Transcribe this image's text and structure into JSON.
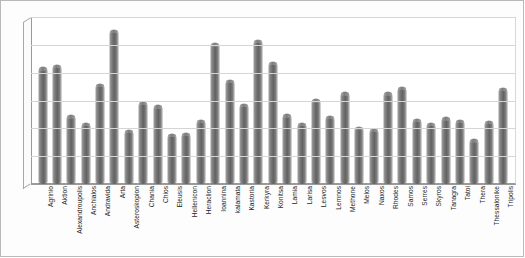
{
  "chart_data": {
    "type": "bar",
    "title": "",
    "subtitle": "",
    "xlabel": "",
    "ylabel": "",
    "ylim": [
      0,
      1200
    ],
    "ytick_step": 200,
    "yticks": [
      0,
      200,
      400,
      600,
      800,
      1000,
      1200
    ],
    "grid": true,
    "legend": "none",
    "style": "3d-cylinder",
    "bar_color": "#6e6e6e",
    "gridline_color": "#d5d5d5",
    "axis_color": "#9a9a9a",
    "background_color": "#ffffff",
    "categories": [
      "Agrinio",
      "Aktion",
      "Alexandroupolis",
      "Anchialos",
      "Andravida",
      "Arta",
      "Asteroskopion",
      "Chania",
      "Chios",
      "Eleusis",
      "Hellenicon",
      "Heraclion",
      "Ioannina",
      "kalamata",
      "Kastoria",
      "Kerkyra",
      "Konitsa",
      "Lamia",
      "Larisa",
      "Lesvos",
      "Lemnos",
      "Methone",
      "Melos",
      "Naxos",
      "Rhodes",
      "Samos",
      "Serres",
      "Skyros",
      "Tanagra",
      "Tatoi",
      "Thera",
      "Thessalonike",
      "Tripolis"
    ],
    "values": [
      840,
      855,
      495,
      440,
      720,
      1110,
      390,
      590,
      565,
      360,
      370,
      460,
      1010,
      750,
      575,
      1035,
      880,
      500,
      440,
      610,
      490,
      660,
      410,
      395,
      660,
      700,
      470,
      440,
      480,
      460,
      320,
      455,
      690
    ]
  }
}
